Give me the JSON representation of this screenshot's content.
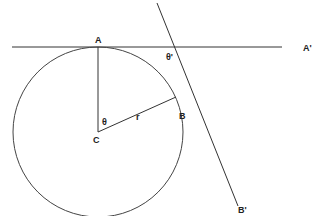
{
  "diagram": {
    "labels": {
      "A": "A",
      "A_prime": "A'",
      "B": "B",
      "B_prime": "B'",
      "C": "C",
      "r": "r",
      "theta": "θ",
      "theta_prime": "θ'"
    },
    "line_color": "#333333"
  }
}
